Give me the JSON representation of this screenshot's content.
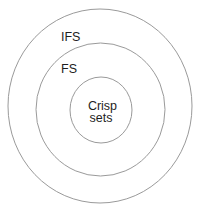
{
  "diagram": {
    "type": "nested-sets",
    "sets": [
      {
        "label": "IFS",
        "level": "outer"
      },
      {
        "label": "FS",
        "level": "middle"
      },
      {
        "label_lines": [
          "Crisp",
          "sets"
        ],
        "level": "inner"
      }
    ],
    "colors": {
      "stroke": "#9a9a9a",
      "text": "#1e1e1e",
      "background": "#ffffff"
    }
  }
}
